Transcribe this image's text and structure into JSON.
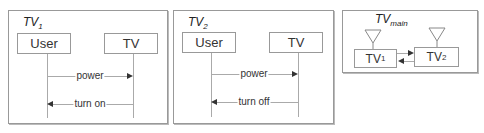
{
  "panels": [
    {
      "title": "TV",
      "title_sub": "1",
      "lifelines": [
        "User",
        "TV"
      ],
      "messages": [
        {
          "label": "power",
          "from": "User",
          "to": "TV"
        },
        {
          "label": "turn on",
          "from": "TV",
          "to": "User"
        }
      ]
    },
    {
      "title": "TV",
      "title_sub": "2",
      "lifelines": [
        "User",
        "TV"
      ],
      "messages": [
        {
          "label": "power",
          "from": "User",
          "to": "TV"
        },
        {
          "label": "turn off",
          "from": "TV",
          "to": "User"
        }
      ]
    }
  ],
  "main": {
    "title": "TV",
    "title_sub": "main",
    "components": [
      {
        "label": "TV",
        "sub": "1"
      },
      {
        "label": "TV",
        "sub": "2"
      }
    ]
  }
}
